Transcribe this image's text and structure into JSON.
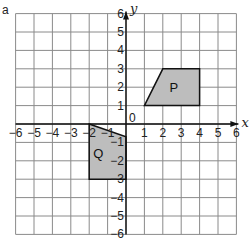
{
  "corner_mark": "a",
  "grid": {
    "xmin": -6,
    "xmax": 6,
    "ymin": -6,
    "ymax": 6,
    "origin_px": [
      126,
      124
    ],
    "cell_px": 18.4,
    "grid_color": "#8a8a8a",
    "axis_color": "#111111"
  },
  "axes": {
    "x_label": "x",
    "y_label": "y",
    "origin_label": "0",
    "x_ticks": [
      "-6",
      "-5",
      "-4",
      "-3",
      "-2",
      "-1",
      "1",
      "2",
      "3",
      "4",
      "5",
      "6"
    ],
    "y_ticks": [
      "-6",
      "-5",
      "-4",
      "-3",
      "-2",
      "-1",
      "1",
      "2",
      "3",
      "4",
      "5",
      "6"
    ]
  },
  "shapes": [
    {
      "name": "P",
      "label": "P",
      "fill": "#bdbdbd",
      "vertices": [
        [
          1,
          1
        ],
        [
          2,
          3
        ],
        [
          4,
          3
        ],
        [
          4,
          1
        ]
      ],
      "label_pos": [
        2.6,
        2
      ]
    },
    {
      "name": "Q",
      "label": "Q",
      "fill": "#bdbdbd",
      "vertices": [
        [
          -2,
          0
        ],
        [
          0,
          -0.7
        ],
        [
          0,
          -3
        ],
        [
          -2,
          -3
        ]
      ],
      "label_pos": [
        -1.5,
        -1.6
      ]
    }
  ]
}
